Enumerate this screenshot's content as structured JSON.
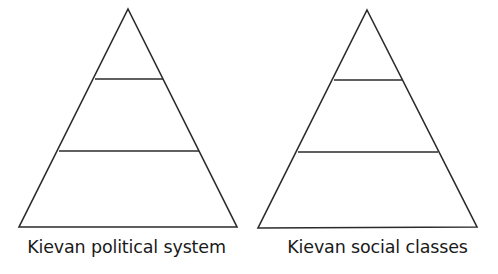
{
  "figure": {
    "background_color": "#ffffff",
    "line_color": "#2b2b2b",
    "text_color": "#1a1a1a"
  },
  "diagrams": [
    {
      "id": "kievan-political-system",
      "caption": "Kievan political system",
      "tier_count": 3,
      "apex": {
        "x": 128,
        "y": 9
      },
      "base_left": {
        "x": 19,
        "y": 227
      },
      "base_right": {
        "x": 237,
        "y": 227
      },
      "dividers": [
        {
          "y": 79,
          "x1": 95,
          "x2": 163
        },
        {
          "y": 151,
          "x1": 59,
          "x2": 199
        }
      ]
    },
    {
      "id": "kievan-social-classes",
      "caption": "Kievan social classes",
      "tier_count": 3,
      "apex": {
        "x": 367,
        "y": 10
      },
      "base_left": {
        "x": 258,
        "y": 228
      },
      "base_right": {
        "x": 477,
        "y": 227
      },
      "dividers": [
        {
          "y": 80,
          "x1": 334,
          "x2": 402
        },
        {
          "y": 152,
          "x1": 298,
          "x2": 438
        }
      ]
    }
  ]
}
